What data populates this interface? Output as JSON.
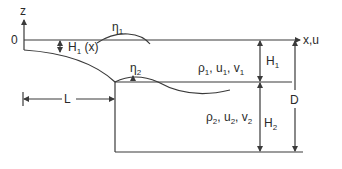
{
  "diagram": {
    "axes": {
      "vertical": {
        "label": "z"
      },
      "horizontal": {
        "label": "x,u"
      },
      "origin": {
        "label": "0"
      }
    },
    "layers": [
      {
        "name": "upper",
        "density": "ρ",
        "density_sub": "1",
        "u": "u",
        "u_sub": "1",
        "v": "v",
        "v_sub": "1",
        "sep1": ", ",
        "sep2": ", "
      },
      {
        "name": "lower",
        "density": "ρ",
        "density_sub": "2",
        "u": "u",
        "u_sub": "2",
        "v": "v",
        "v_sub": "2",
        "sep1": ", ",
        "sep2": ", "
      }
    ],
    "labels": {
      "eta1": {
        "base": "η",
        "sub": "1"
      },
      "eta2": {
        "base": "η",
        "sub": "2"
      },
      "H1x": {
        "base": "H",
        "sub": "1",
        "suffix": " (x)"
      },
      "H1": {
        "base": "H",
        "sub": "1"
      },
      "H2": {
        "base": "H",
        "sub": "2"
      },
      "D": "D",
      "L": "L"
    },
    "colors": {
      "line": "#3a3a3a",
      "text": "#2a2a2a",
      "background": "#ffffff"
    }
  }
}
